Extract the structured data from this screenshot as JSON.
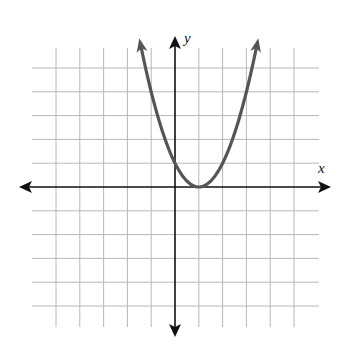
{
  "chart_data": {
    "type": "line",
    "title": "",
    "function": "y = (x - 1)^2",
    "xlabel": "x",
    "ylabel": "y",
    "xlim": [
      -6,
      6
    ],
    "ylim": [
      -6,
      6
    ],
    "grid": true,
    "grid_step": 1,
    "tick_labels": false,
    "series": [
      {
        "name": "parabola",
        "color": "#555555",
        "x": [
          -1.45,
          -1,
          0,
          1,
          2,
          3,
          3.45
        ],
        "y": [
          6.0,
          4,
          1,
          0,
          1,
          4,
          6.0
        ],
        "arrows_at_ends": true
      }
    ],
    "vertex": [
      1,
      0
    ],
    "y_intercept": 1
  },
  "labels": {
    "x_axis": "x",
    "y_axis": "y"
  },
  "colors": {
    "grid": "#b8b8b8",
    "axes": "#111111",
    "curve": "#555555"
  }
}
